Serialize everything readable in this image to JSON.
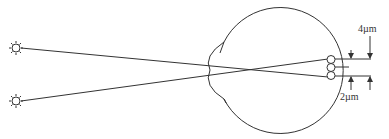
{
  "diagram": {
    "sources": [
      {
        "name": "source-top",
        "icon": "sun-star-icon"
      },
      {
        "name": "source-bottom",
        "icon": "sun-star-icon"
      }
    ],
    "labels": {
      "cone_spacing": "4µm",
      "image_separation": "2µm"
    },
    "colors": {
      "stroke": "#333333",
      "background": "#ffffff"
    },
    "cone_count": 3
  }
}
